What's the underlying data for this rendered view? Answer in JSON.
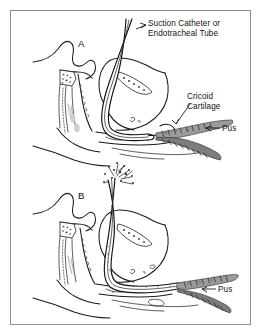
{
  "figure": {
    "kind": "medical-illustration",
    "border_color": "#8f8f8f",
    "background_color": "#ffffff",
    "ink_color": "#1a1a1a",
    "pus_color": "#9b9b9b",
    "width": 263,
    "height": 336
  },
  "labels": {
    "title_line1": "Suction Catheter or",
    "title_line2": "Endotracheal Tube",
    "cricoid_line1": "Cricoid",
    "cricoid_line2": "Cartilage",
    "pus_upper": "Pus",
    "pus_lower": "Pus"
  },
  "panels": [
    {
      "letter": "A",
      "caption_letter": "A",
      "stage": "tube tip positioned above the obstruction",
      "pus_present": true
    },
    {
      "letter": "B",
      "caption_letter": "B",
      "stage": "tube advanced; pus expelled through the tube",
      "pus_present": true
    }
  ],
  "annotations": [
    {
      "name": "suction-catheter-leader",
      "target": "catheter tube shaft",
      "panel": "A"
    },
    {
      "name": "cricoid-cartilage-leader",
      "target": "cricoid cartilage ring",
      "panel": "A"
    },
    {
      "name": "pus-leader-upper",
      "target": "pus collection in trachea",
      "panel": "A"
    },
    {
      "name": "pus-leader-lower",
      "target": "pus collection in trachea",
      "panel": "B"
    }
  ]
}
